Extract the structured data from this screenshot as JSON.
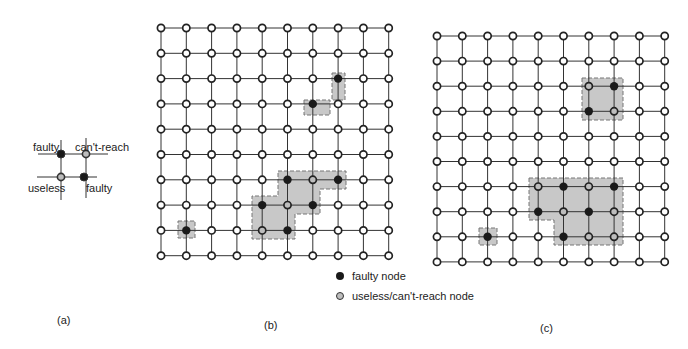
{
  "panel_a": {
    "caption": "(a)",
    "labels": {
      "top_left": "faulty",
      "top_right": "can't-reach",
      "bottom_left": "useless",
      "bottom_right": "faulty"
    }
  },
  "panel_b": {
    "caption": "(b)",
    "rows": 10,
    "cols": 10,
    "origin": [
      161,
      28
    ],
    "step": [
      25.3,
      25.3
    ],
    "faulty": [
      [
        2,
        7
      ],
      [
        3,
        6
      ],
      [
        6,
        5
      ],
      [
        6,
        7
      ],
      [
        7,
        4
      ],
      [
        7,
        6
      ],
      [
        8,
        1
      ],
      [
        8,
        5
      ]
    ],
    "useless": [
      [
        6,
        6
      ],
      [
        7,
        5
      ],
      [
        8,
        4
      ]
    ],
    "regions": [
      {
        "points": "332,73 345,73 345,100 332,100"
      },
      {
        "points": "304,100 330,100 330,115 304,115"
      },
      {
        "points": "278,171 346,171 346,189 320,189 320,214 295,214 295,239 252,239 252,196 278,196"
      },
      {
        "points": "178,221 195,221 195,238 178,238"
      }
    ]
  },
  "panel_c": {
    "caption": "(c)",
    "rows": 10,
    "cols": 10,
    "origin": [
      437,
      36
    ],
    "step": [
      25.3,
      25.1
    ],
    "faulty": [
      [
        2,
        7
      ],
      [
        3,
        6
      ],
      [
        6,
        5
      ],
      [
        6,
        7
      ],
      [
        7,
        4
      ],
      [
        7,
        6
      ],
      [
        8,
        2
      ],
      [
        8,
        5
      ]
    ],
    "useless": [
      [
        2,
        6
      ],
      [
        3,
        7
      ],
      [
        6,
        4
      ],
      [
        6,
        6
      ],
      [
        7,
        5
      ],
      [
        7,
        7
      ],
      [
        8,
        6
      ],
      [
        8,
        7
      ]
    ],
    "regions": [
      {
        "points": "582,78 623,78 623,120 582,120"
      },
      {
        "points": "529,178 623,178 623,245 554,245 554,220 529,220"
      },
      {
        "points": "479,228 497,228 497,245 479,245"
      }
    ]
  },
  "legend": {
    "faulty_label": "faulty node",
    "useless_label": "useless/can't-reach node"
  },
  "colors": {
    "faulty": "#1a1a1a",
    "useless_fill": "#bdbdbd",
    "region": "#c8c8c8",
    "line": "#333333"
  }
}
